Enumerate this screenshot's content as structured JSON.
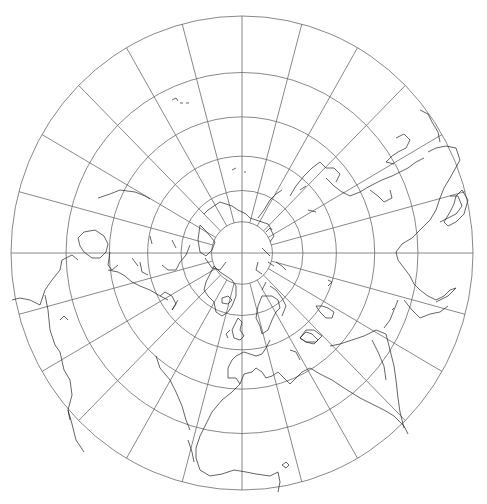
{
  "map": {
    "projection": "polar-azimuthal-north",
    "center": {
      "x": 242,
      "y": 253
    },
    "parallel_radii": [
      31,
      62,
      96,
      135,
      179,
      235
    ],
    "outer_radius_x": 231,
    "outer_radius_y": 237,
    "meridian_step_deg": 15,
    "meridian_count": 24,
    "colors": {
      "background": "#ffffff",
      "graticule": "#6a6a6a",
      "coastline": "#222222"
    }
  }
}
